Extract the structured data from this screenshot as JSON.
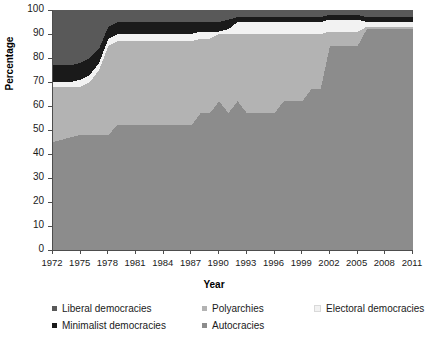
{
  "chart_data": {
    "type": "area",
    "stacked": true,
    "title": "",
    "xlabel": "Year",
    "ylabel": "Percentage",
    "ylim": [
      0,
      100
    ],
    "ytick_labels": [
      "0",
      "10",
      "20",
      "30",
      "40",
      "50",
      "60",
      "70",
      "80",
      "90",
      "100"
    ],
    "xtick_labels": [
      "1972",
      "1975",
      "1978",
      "1981",
      "1984",
      "1987",
      "1990",
      "1993",
      "1996",
      "1999",
      "2002",
      "2005",
      "2008",
      "2011"
    ],
    "grid": false,
    "legend_position": "bottom",
    "x": [
      1972,
      1973,
      1974,
      1975,
      1976,
      1977,
      1978,
      1979,
      1980,
      1981,
      1982,
      1983,
      1984,
      1985,
      1986,
      1987,
      1988,
      1989,
      1990,
      1991,
      1992,
      1993,
      1994,
      1995,
      1996,
      1997,
      1998,
      1999,
      2000,
      2001,
      2002,
      2003,
      2004,
      2005,
      2006,
      2007,
      2008,
      2009,
      2010,
      2011
    ],
    "stack_order_bottom_to_top": [
      "Autocracies",
      "Polyarchies",
      "Electoral democracies",
      "Minimalist democracies",
      "Liberal democracies"
    ],
    "series": [
      {
        "name": "Autocracies",
        "color": "#8c8c8c",
        "values": [
          45,
          46,
          47,
          48,
          48,
          48,
          48,
          52,
          52,
          52,
          52,
          52,
          52,
          52,
          52,
          52,
          57,
          57,
          62,
          57,
          62,
          57,
          57,
          57,
          57,
          62,
          62,
          62,
          67,
          67,
          85,
          85,
          85,
          85,
          92,
          92,
          92,
          92,
          92,
          92
        ]
      },
      {
        "name": "Polyarchies",
        "color": "#b3b3b3",
        "values": [
          23,
          22,
          21,
          20,
          22,
          27,
          37,
          35,
          35,
          35,
          35,
          35,
          35,
          35,
          35,
          35,
          31,
          31,
          28,
          33,
          28,
          33,
          33,
          33,
          33,
          28,
          28,
          28,
          23,
          23,
          6,
          6,
          6,
          6,
          1,
          1,
          1,
          1,
          1,
          1
        ]
      },
      {
        "name": "Electoral democracies",
        "color": "#f2f2f2",
        "values": [
          2,
          2,
          2,
          3,
          3,
          3,
          3,
          3,
          3,
          3,
          3,
          3,
          3,
          3,
          3,
          3,
          3,
          3,
          1,
          2,
          5,
          5,
          5,
          5,
          5,
          5,
          5,
          5,
          5,
          5,
          5,
          5,
          5,
          5,
          2,
          2,
          2,
          2,
          2,
          2
        ]
      },
      {
        "name": "Minimalist democracies",
        "color": "#1a1a1a",
        "values": [
          7,
          7,
          7,
          7,
          7,
          6,
          5,
          5,
          5,
          5,
          5,
          5,
          5,
          5,
          5,
          5,
          4,
          4,
          4,
          4,
          2,
          2,
          2,
          2,
          2,
          2,
          2,
          2,
          2,
          2,
          2,
          2,
          2,
          2,
          2,
          2,
          2,
          2,
          2,
          2
        ]
      },
      {
        "name": "Liberal democracies",
        "color": "#595959",
        "values": [
          23,
          23,
          23,
          22,
          20,
          16,
          7,
          5,
          5,
          5,
          5,
          5,
          5,
          5,
          5,
          5,
          5,
          5,
          5,
          4,
          3,
          3,
          3,
          3,
          3,
          3,
          3,
          3,
          3,
          3,
          2,
          2,
          2,
          2,
          3,
          3,
          3,
          3,
          3,
          3
        ]
      }
    ],
    "cumulative_top_boundaries": {
      "autocracies_top": [
        45,
        46,
        47,
        48,
        48,
        48,
        48,
        52,
        52,
        52,
        52,
        52,
        52,
        52,
        52,
        52,
        57,
        57,
        62,
        57,
        62,
        57,
        57,
        57,
        57,
        62,
        62,
        62,
        67,
        67,
        85,
        85,
        85,
        85,
        92,
        92,
        92,
        92,
        92,
        92
      ],
      "polyarchies_top": [
        68,
        68,
        68,
        68,
        70,
        75,
        85,
        87,
        87,
        87,
        87,
        87,
        87,
        87,
        87,
        87,
        88,
        88,
        90,
        90,
        90,
        90,
        90,
        90,
        90,
        90,
        90,
        90,
        90,
        90,
        91,
        91,
        91,
        91,
        93,
        93,
        93,
        93,
        93,
        93
      ],
      "electoral_top": [
        70,
        70,
        70,
        71,
        73,
        78,
        88,
        90,
        90,
        90,
        90,
        90,
        90,
        90,
        90,
        90,
        91,
        91,
        91,
        92,
        95,
        95,
        95,
        95,
        95,
        95,
        95,
        95,
        95,
        95,
        96,
        96,
        96,
        96,
        95,
        95,
        95,
        95,
        95,
        95
      ],
      "minimalist_top": [
        77,
        77,
        77,
        78,
        80,
        84,
        93,
        95,
        95,
        95,
        95,
        95,
        95,
        95,
        95,
        95,
        95,
        95,
        95,
        96,
        97,
        97,
        97,
        97,
        97,
        97,
        97,
        97,
        97,
        97,
        98,
        98,
        98,
        98,
        97,
        97,
        97,
        97,
        97,
        97
      ],
      "liberal_top": [
        100,
        100,
        100,
        100,
        100,
        100,
        100,
        100,
        100,
        100,
        100,
        100,
        100,
        100,
        100,
        100,
        100,
        100,
        100,
        100,
        100,
        100,
        100,
        100,
        100,
        100,
        100,
        100,
        100,
        100,
        100,
        100,
        100,
        100,
        100,
        100,
        100,
        100,
        100,
        100
      ]
    }
  },
  "legend": {
    "items": [
      {
        "label": "Liberal democracies",
        "color": "#595959"
      },
      {
        "label": "Polyarchies",
        "color": "#b3b3b3"
      },
      {
        "label": "Electoral democracies",
        "color": "#f2f2f2"
      },
      {
        "label": "Minimalist democracies",
        "color": "#1a1a1a"
      },
      {
        "label": "Autocracies",
        "color": "#8c8c8c"
      }
    ]
  }
}
